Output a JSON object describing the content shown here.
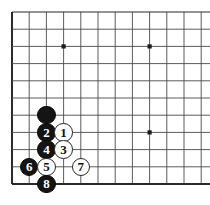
{
  "board": {
    "title": "Go board corner diagram",
    "board_color": "#ffffff",
    "line_color": "#4a4a4a",
    "edge_line_color": "#2b2b2b",
    "star_point_color": "#1a1a1a",
    "black_stone_color": "#141414",
    "white_stone_color": "#ffffff",
    "black_label_color": "#ffffff",
    "white_label_color": "#111111",
    "origin_x": 12,
    "origin_y": 12,
    "spacing": 17.2,
    "cols": 12,
    "rows": 11,
    "stone_radius": 9.2,
    "star_points": [
      {
        "col": 3,
        "row": 2
      },
      {
        "col": 8,
        "row": 2
      },
      {
        "col": 8,
        "row": 7
      }
    ],
    "stones": [
      {
        "id": "stone-black-unnumbered",
        "col": 2,
        "row": 6,
        "color": "black",
        "label": ""
      },
      {
        "id": "stone-2",
        "col": 2,
        "row": 7,
        "color": "black",
        "label": "2"
      },
      {
        "id": "stone-1",
        "col": 3,
        "row": 7,
        "color": "white",
        "label": "1"
      },
      {
        "id": "stone-4",
        "col": 2,
        "row": 8,
        "color": "black",
        "label": "4"
      },
      {
        "id": "stone-3",
        "col": 3,
        "row": 8,
        "color": "white",
        "label": "3"
      },
      {
        "id": "stone-6",
        "col": 1,
        "row": 9,
        "color": "black",
        "label": "6"
      },
      {
        "id": "stone-5",
        "col": 2,
        "row": 9,
        "color": "white",
        "label": "5"
      },
      {
        "id": "stone-7",
        "col": 4,
        "row": 9,
        "color": "white",
        "label": "7"
      },
      {
        "id": "stone-8",
        "col": 2,
        "row": 10,
        "color": "black",
        "label": "8"
      }
    ]
  }
}
